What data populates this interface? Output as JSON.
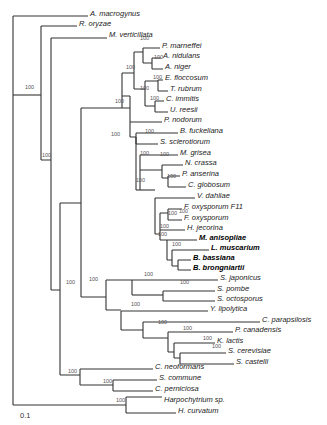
{
  "figure": {
    "type": "phylogenetic-tree",
    "scale_label": "0.1",
    "leaves": [
      {
        "name": "A. macrogynus",
        "x": 90,
        "y": 14
      },
      {
        "name": "R. oryzae",
        "x": 79,
        "y": 24
      },
      {
        "name": "M. verticillata",
        "x": 109,
        "y": 35
      },
      {
        "name": "P. marneffei",
        "x": 162,
        "y": 46
      },
      {
        "name": "A. nidulans",
        "x": 163,
        "y": 56
      },
      {
        "name": "A. niger",
        "x": 165,
        "y": 67
      },
      {
        "name": "E. floccosum",
        "x": 165,
        "y": 78
      },
      {
        "name": "T. rubrum",
        "x": 170,
        "y": 89
      },
      {
        "name": "C. immitis",
        "x": 166,
        "y": 99
      },
      {
        "name": "U. reesii",
        "x": 170,
        "y": 110
      },
      {
        "name": "P. nodorum",
        "x": 164,
        "y": 120
      },
      {
        "name": "B. fuckeliana",
        "x": 180,
        "y": 131
      },
      {
        "name": "S. sclerotiorum",
        "x": 160,
        "y": 142
      },
      {
        "name": "M. grisea",
        "x": 180,
        "y": 153
      },
      {
        "name": "N. crassa",
        "x": 185,
        "y": 163
      },
      {
        "name": "P. anserina",
        "x": 182,
        "y": 174
      },
      {
        "name": "C. globosum",
        "x": 188,
        "y": 185
      },
      {
        "name": "V. dahliae",
        "x": 197,
        "y": 196
      },
      {
        "name": "F. oxysporum F11",
        "x": 184,
        "y": 207
      },
      {
        "name": "F. oxysporum",
        "x": 184,
        "y": 218
      },
      {
        "name": "H. jecorina",
        "x": 187,
        "y": 228
      },
      {
        "name": "M. anisopliae",
        "x": 199,
        "y": 238,
        "bold": true
      },
      {
        "name": "L. muscarium",
        "x": 211,
        "y": 248,
        "bold": true
      },
      {
        "name": "B. bassiana",
        "x": 193,
        "y": 258,
        "bold": true
      },
      {
        "name": "B. brongniartii",
        "x": 193,
        "y": 268,
        "bold": true
      },
      {
        "name": "S. japonicus",
        "x": 220,
        "y": 278
      },
      {
        "name": "S. pombe",
        "x": 217,
        "y": 289
      },
      {
        "name": "S. octosporus",
        "x": 217,
        "y": 299
      },
      {
        "name": "Y. lipolytica",
        "x": 210,
        "y": 309
      },
      {
        "name": "C. parapsilosis",
        "x": 262,
        "y": 320
      },
      {
        "name": "P. canadensis",
        "x": 235,
        "y": 330
      },
      {
        "name": "K. lactis",
        "x": 217,
        "y": 341
      },
      {
        "name": "S. cerevisiae",
        "x": 228,
        "y": 351
      },
      {
        "name": "S. castelli",
        "x": 236,
        "y": 362
      },
      {
        "name": "C. neoformans",
        "x": 155,
        "y": 367
      },
      {
        "name": "S. commune",
        "x": 159,
        "y": 378
      },
      {
        "name": "C. perniciosa",
        "x": 155,
        "y": 389
      },
      {
        "name": "Harpochytrium sp.",
        "x": 164,
        "y": 400,
        "plain_suffix": true
      },
      {
        "name": "H. curvatum",
        "x": 178,
        "y": 411
      }
    ],
    "bootstrap_labels": [
      {
        "value": "100",
        "x": 25,
        "y": 89
      },
      {
        "value": "100",
        "x": 42,
        "y": 157
      },
      {
        "value": "100",
        "x": 66,
        "y": 284
      },
      {
        "value": "100",
        "x": 140,
        "y": 40
      },
      {
        "value": "100",
        "x": 154,
        "y": 59
      },
      {
        "value": "100",
        "x": 126,
        "y": 69
      },
      {
        "value": "100",
        "x": 153,
        "y": 79
      },
      {
        "value": "100",
        "x": 140,
        "y": 90
      },
      {
        "value": "100",
        "x": 150,
        "y": 100
      },
      {
        "value": "100",
        "x": 115,
        "y": 103
      },
      {
        "value": "100",
        "x": 111,
        "y": 136
      },
      {
        "value": "100",
        "x": 145,
        "y": 133
      },
      {
        "value": "100",
        "x": 140,
        "y": 155
      },
      {
        "value": "100",
        "x": 160,
        "y": 156
      },
      {
        "value": "100",
        "x": 167,
        "y": 178
      },
      {
        "value": "100",
        "x": 136,
        "y": 182
      },
      {
        "value": "100",
        "x": 168,
        "y": 215
      },
      {
        "value": "100",
        "x": 179,
        "y": 213
      },
      {
        "value": "100",
        "x": 158,
        "y": 236
      },
      {
        "value": "100",
        "x": 160,
        "y": 228
      },
      {
        "value": "100",
        "x": 172,
        "y": 246
      },
      {
        "value": "100",
        "x": 89,
        "y": 281
      },
      {
        "value": "100",
        "x": 144,
        "y": 276
      },
      {
        "value": "100",
        "x": 180,
        "y": 284
      },
      {
        "value": "100",
        "x": 131,
        "y": 306
      },
      {
        "value": "100",
        "x": 158,
        "y": 324
      },
      {
        "value": "100",
        "x": 183,
        "y": 330
      },
      {
        "value": "100",
        "x": 203,
        "y": 340
      },
      {
        "value": "100",
        "x": 212,
        "y": 348
      },
      {
        "value": "100",
        "x": 68,
        "y": 373
      },
      {
        "value": "100",
        "x": 103,
        "y": 383
      },
      {
        "value": "100",
        "x": 116,
        "y": 402
      }
    ]
  }
}
